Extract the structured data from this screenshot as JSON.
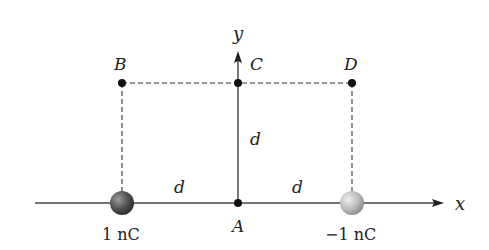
{
  "diagram": {
    "axes": {
      "x_label": "x",
      "y_label": "y"
    },
    "points": [
      {
        "id": "A",
        "label": "A",
        "position": "origin on x-axis"
      },
      {
        "id": "B",
        "label": "B",
        "position": "above left charge"
      },
      {
        "id": "C",
        "label": "C",
        "position": "on y-axis at height d"
      },
      {
        "id": "D",
        "label": "D",
        "position": "above right charge"
      }
    ],
    "charges": [
      {
        "id": "q1",
        "label": "1 nC",
        "color": "#555555"
      },
      {
        "id": "q2",
        "label": "−1 nC",
        "color": "#bbbbbb"
      }
    ],
    "distances": {
      "left": "d",
      "right": "d",
      "vertical": "d"
    },
    "colors": {
      "line": "#333333",
      "dashed": "#333333",
      "dot": "#111111"
    }
  }
}
